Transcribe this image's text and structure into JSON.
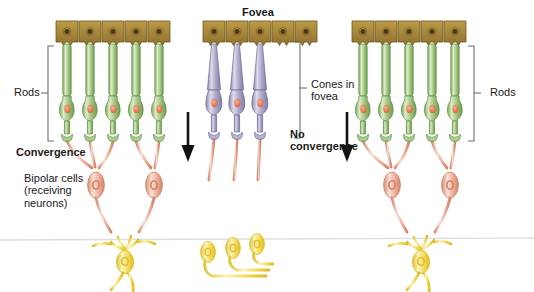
{
  "figure": {
    "title_center": "Fovea"
  },
  "labels": {
    "rods_left": "Rods",
    "rods_right": "Rods",
    "convergence": "Convergence",
    "bipolar_cells": "Bipolar cells\n(receiving\nneurons)",
    "cones_in_fovea": "Cones in\nfovea",
    "no_convergence": "No\nconvergence",
    "fovea": "Fovea"
  },
  "colors": {
    "epithelium_fill": "#a9883d",
    "epithelium_stroke": "#6d5520",
    "epithelium_nucleus": "#4a3a14",
    "rod_fill": "#9cc47c",
    "rod_light": "#d7e9c6",
    "rod_stroke": "#5f8a43",
    "cone_fill": "#a9a4c7",
    "cone_light": "#d7d4e6",
    "cone_stroke": "#6f6a93",
    "nucleus_orange": "#e8825a",
    "bipolar_fill": "#e8a089",
    "bipolar_light": "#f7ded4",
    "bipolar_stroke": "#cf7f66",
    "ganglion_fill": "#f0d445",
    "ganglion_light": "#fbf1b0",
    "ganglion_stroke": "#ddbc2a",
    "arrow_black": "#121212",
    "bracket_gray": "#6d6d6d",
    "baseline_gray": "#dedede",
    "text": "#1a1a1a",
    "background": "#ffffff"
  },
  "groups": [
    {
      "name": "left-periphery",
      "cell_type": "rod",
      "photoreceptor_count": 5,
      "bipolar_count": 2,
      "ganglion_count": 1,
      "convergence": "yes"
    },
    {
      "name": "fovea-center",
      "cell_type": "cone",
      "photoreceptor_count": 3,
      "bipolar_count": 3,
      "ganglion_count": 3,
      "convergence": "no"
    },
    {
      "name": "right-periphery",
      "cell_type": "rod",
      "photoreceptor_count": 5,
      "bipolar_count": 2,
      "ganglion_count": 1,
      "convergence": "yes"
    }
  ],
  "arrows": [
    {
      "name": "flow-arrow-left",
      "direction": "down"
    },
    {
      "name": "flow-arrow-right",
      "direction": "down"
    }
  ]
}
